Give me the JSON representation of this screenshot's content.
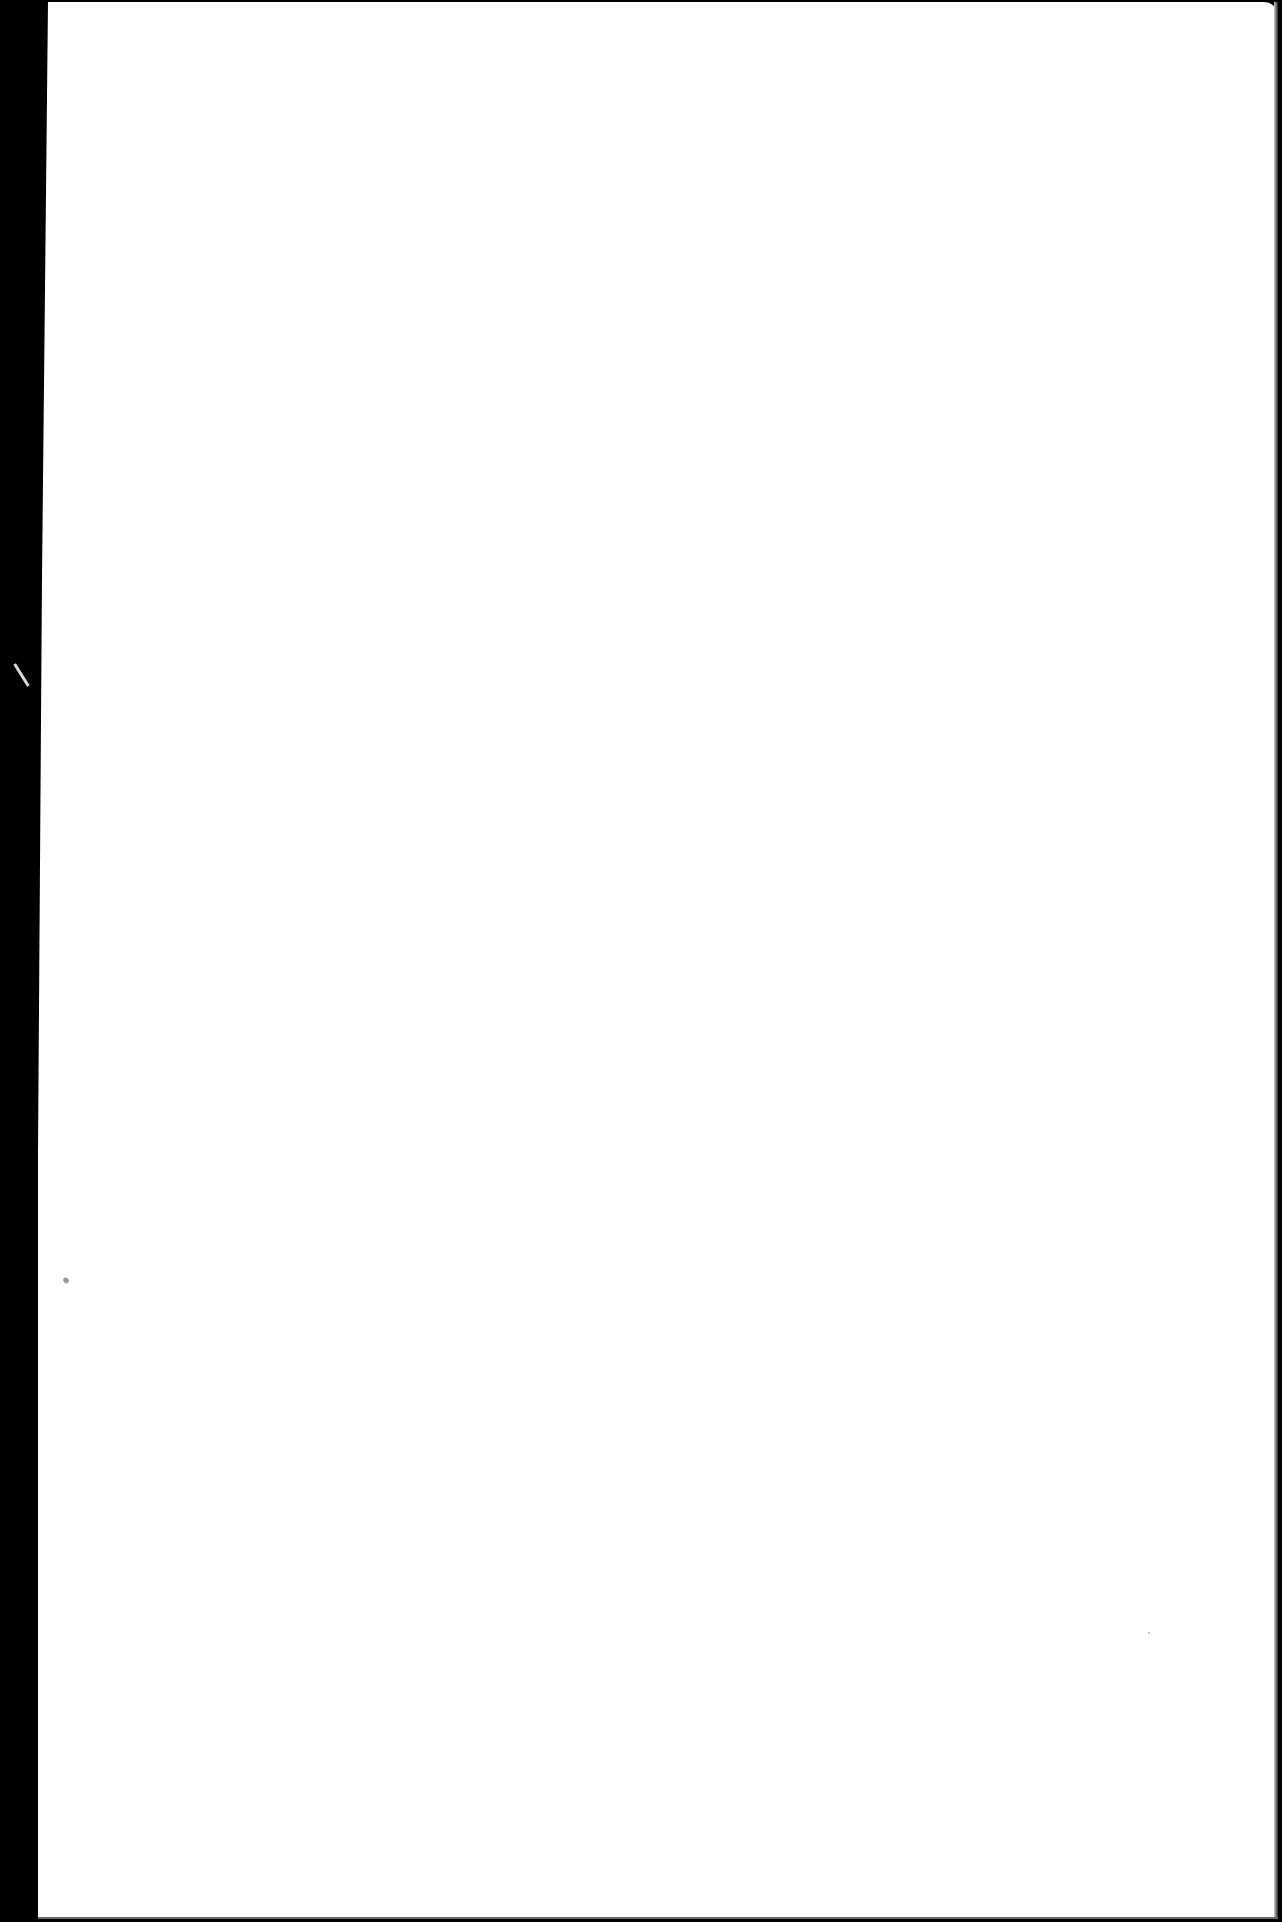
{
  "document": {
    "type": "scanned-page",
    "content": "",
    "colors": {
      "paper": "#ffffff",
      "scanner_background": "#000000"
    }
  }
}
